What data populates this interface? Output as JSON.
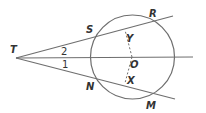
{
  "diagram": {
    "stroke_color": "#6e6e6e",
    "text_color": "#333333",
    "circle": {
      "name": "O",
      "cx": 132.5,
      "cy": 57,
      "r": 42
    },
    "points": {
      "T": {
        "label": "T",
        "x": 16,
        "y": 58
      },
      "S": {
        "label": "S",
        "x": 91,
        "y": 36
      },
      "R": {
        "label": "R",
        "x": 162,
        "y": 19
      },
      "N": {
        "label": "N",
        "x": 91,
        "y": 75
      },
      "M": {
        "label": "M",
        "x": 157,
        "y": 94
      },
      "O": {
        "label": "O",
        "x": 132,
        "y": 57
      },
      "Y": {
        "label": "Y",
        "x": 125,
        "y": 30
      },
      "X": {
        "label": "X",
        "x": 125,
        "y": 83
      }
    },
    "angle_labels": {
      "angle2": "2",
      "angle1": "1"
    },
    "segments": [
      {
        "name": "secant-TR",
        "from": "T",
        "to_end": [
          173,
          16
        ],
        "style": "solid"
      },
      {
        "name": "secant-TM",
        "from": "T",
        "to_end": [
          175,
          99
        ],
        "style": "solid"
      },
      {
        "name": "ray-TO",
        "from": "T",
        "to_end": [
          193,
          57
        ],
        "style": "solid"
      },
      {
        "name": "segment-OY",
        "from": "O",
        "to": "Y",
        "style": "dashed"
      },
      {
        "name": "segment-OX",
        "from": "O",
        "to": "X",
        "style": "dashed"
      }
    ]
  }
}
